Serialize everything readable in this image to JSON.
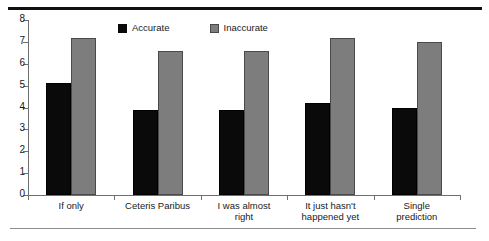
{
  "chart_data": {
    "type": "bar",
    "title": "",
    "subtitle": "",
    "xlabel": "",
    "ylabel": "",
    "ylim": [
      0,
      8
    ],
    "ytick_labels": [
      "0",
      "1",
      "2",
      "3",
      "4",
      "5",
      "6",
      "7",
      "8"
    ],
    "ytick_values": [
      0,
      1,
      2,
      3,
      4,
      5,
      6,
      7,
      8
    ],
    "grid": false,
    "legend_position": "top-center",
    "categories": [
      "If only",
      "Ceteris Paribus",
      "I was almost right",
      "It just hasn't happened yet",
      "Single prediction"
    ],
    "category_lines": [
      [
        "If only"
      ],
      [
        "Ceteris Paribus"
      ],
      [
        "I was almost",
        "right"
      ],
      [
        "It just hasn't",
        "happened yet"
      ],
      [
        "Single",
        "prediction"
      ]
    ],
    "series": [
      {
        "name": "Accurate",
        "color": "#0a0a0a",
        "values": [
          5.1,
          3.9,
          3.9,
          4.2,
          4.0
        ]
      },
      {
        "name": "Inaccurate",
        "color": "#7d7d7d",
        "values": [
          7.2,
          6.6,
          6.6,
          7.2,
          7.0
        ]
      }
    ]
  },
  "legend": {
    "items": [
      {
        "label": "Accurate",
        "swatch": "accurate-swatch"
      },
      {
        "label": "Inaccurate",
        "swatch": "inaccurate-swatch"
      }
    ]
  }
}
